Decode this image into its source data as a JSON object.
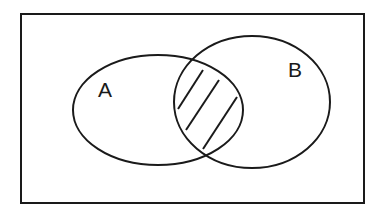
{
  "diagram": {
    "type": "venn",
    "universe": {
      "x": 21,
      "y": 14,
      "width": 343,
      "height": 189
    },
    "sets": [
      {
        "label": "A",
        "cx": 158,
        "cy": 110,
        "rx": 85,
        "ry": 55,
        "label_x": 98,
        "label_y": 97
      },
      {
        "label": "B",
        "cx": 252,
        "cy": 102,
        "rx": 78,
        "ry": 66,
        "label_x": 288,
        "label_y": 77
      }
    ],
    "shaded_region": "A ∩ B",
    "hatch_lines": [
      {
        "x1": 178,
        "y1": 109,
        "x2": 203,
        "y2": 70
      },
      {
        "x1": 186,
        "y1": 130,
        "x2": 219,
        "y2": 80
      },
      {
        "x1": 203,
        "y1": 149,
        "x2": 237,
        "y2": 97
      }
    ],
    "stroke_color": "#1a1a1a"
  }
}
